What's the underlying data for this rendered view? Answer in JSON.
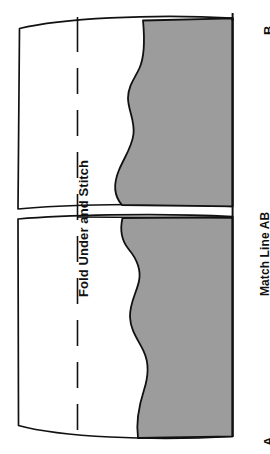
{
  "figure": {
    "background_color": "#ffffff",
    "outline_color": "#111111",
    "shaded_fill": "#9c9c9c"
  },
  "labels": {
    "fold_under_and_stitch": "Fold Under and Stitch",
    "match_line_ab": "Match Line  AB",
    "corner_b": "B",
    "corner_a": "A"
  },
  "elements": {
    "fold_line_name": "fold-under-and-stitch-dashed-line",
    "match_line_name": "match-line-ab-edge",
    "upper_shaded_name": "upper-shaded-region",
    "lower_shaded_name": "lower-shaded-region",
    "divider_name": "match-line-divider"
  }
}
